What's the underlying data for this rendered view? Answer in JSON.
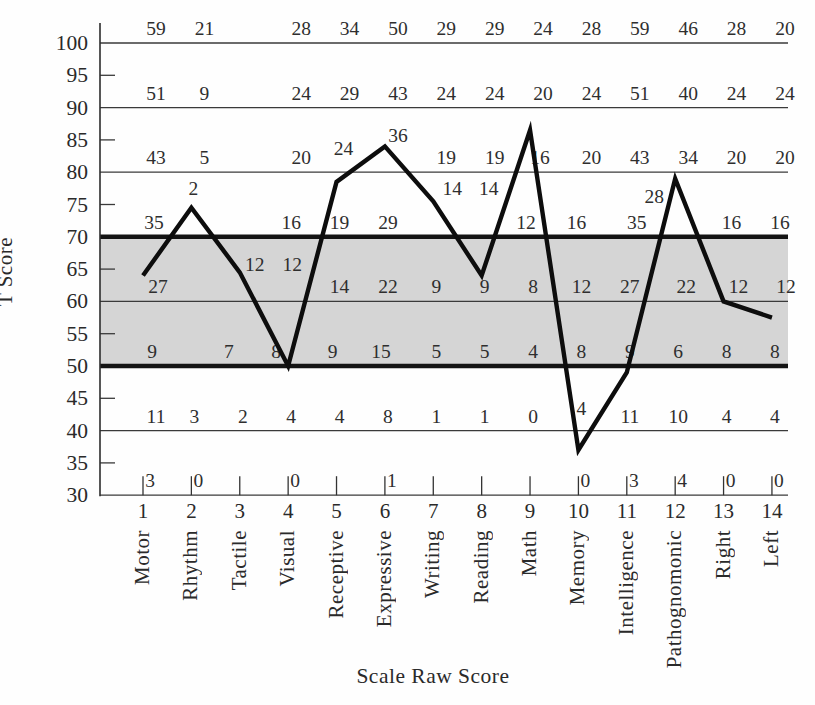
{
  "chart_data": {
    "type": "line",
    "title": "",
    "xlabel": "Scale Raw Score",
    "ylabel": "T Score",
    "ylim": [
      30,
      100
    ],
    "grid": "horizontal-only",
    "legend": "none",
    "y_tick_labels": [
      "100",
      "95",
      "90",
      "85",
      "80",
      "75",
      "70",
      "65",
      "60",
      "55",
      "50",
      "45",
      "40",
      "35",
      "30"
    ],
    "thin_gridlines_t": [
      100,
      90,
      80,
      60,
      40,
      30
    ],
    "thick_gridlines_t": [
      70,
      50
    ],
    "minor_tick_t": [
      95,
      85,
      75,
      65,
      55,
      45,
      35
    ],
    "normal_band": {
      "t_low": 50,
      "t_high": 70,
      "fill": "#d5d5d5"
    },
    "line_color": "#0d0d0d",
    "categories": [
      {
        "num": "1",
        "name": "Motor"
      },
      {
        "num": "2",
        "name": "Rhythm"
      },
      {
        "num": "3",
        "name": "Tactile"
      },
      {
        "num": "4",
        "name": "Visual"
      },
      {
        "num": "5",
        "name": "Receptive"
      },
      {
        "num": "6",
        "name": "Expressive"
      },
      {
        "num": "7",
        "name": "Writing"
      },
      {
        "num": "8",
        "name": "Reading"
      },
      {
        "num": "9",
        "name": "Math"
      },
      {
        "num": "10",
        "name": "Memory"
      },
      {
        "num": "11",
        "name": "Intelligence"
      },
      {
        "num": "12",
        "name": "Pathognomonic"
      },
      {
        "num": "13",
        "name": "Right"
      },
      {
        "num": "14",
        "name": "Left"
      }
    ],
    "series": [
      {
        "name": "T-score profile",
        "values_t": [
          64,
          74.5,
          64.5,
          50,
          78.5,
          84,
          75.5,
          64,
          86.5,
          37,
          49,
          79,
          60,
          57.5
        ]
      }
    ],
    "raw_score_rows": [
      {
        "t": 100,
        "rdx": 13,
        "labels": [
          {
            "col": 1,
            "v": "59"
          },
          {
            "col": 2,
            "v": "21"
          },
          {
            "col": 4,
            "v": "28"
          },
          {
            "col": 5,
            "v": "34"
          },
          {
            "col": 6,
            "v": "50"
          },
          {
            "col": 7,
            "v": "29"
          },
          {
            "col": 8,
            "v": "29"
          },
          {
            "col": 9,
            "v": "24"
          },
          {
            "col": 10,
            "v": "28"
          },
          {
            "col": 11,
            "v": "59"
          },
          {
            "col": 12,
            "v": "46"
          },
          {
            "col": 13,
            "v": "28"
          },
          {
            "col": 14,
            "v": "20"
          }
        ]
      },
      {
        "t": 90,
        "rdx": 13,
        "labels": [
          {
            "col": 1,
            "v": "51"
          },
          {
            "col": 2,
            "v": "9"
          },
          {
            "col": 4,
            "v": "24"
          },
          {
            "col": 5,
            "v": "29"
          },
          {
            "col": 6,
            "v": "43"
          },
          {
            "col": 7,
            "v": "24"
          },
          {
            "col": 8,
            "v": "24"
          },
          {
            "col": 9,
            "v": "20"
          },
          {
            "col": 10,
            "v": "24"
          },
          {
            "col": 11,
            "v": "51"
          },
          {
            "col": 12,
            "v": "40"
          },
          {
            "col": 13,
            "v": "24"
          },
          {
            "col": 14,
            "v": "24"
          }
        ]
      },
      {
        "t": 80,
        "rdx": 13,
        "labels": [
          {
            "col": 1,
            "v": "43"
          },
          {
            "col": 2,
            "v": "5"
          },
          {
            "col": 4,
            "v": "20"
          },
          {
            "col": 5,
            "v": "24",
            "t": 81.4,
            "dx": -6
          },
          {
            "col": 6,
            "v": "36",
            "t": 83.5
          },
          {
            "col": 7,
            "v": "19"
          },
          {
            "col": 8,
            "v": "19"
          },
          {
            "col": 9,
            "v": "16",
            "dx": -3
          },
          {
            "col": 10,
            "v": "20"
          },
          {
            "col": 11,
            "v": "43"
          },
          {
            "col": 12,
            "v": "34"
          },
          {
            "col": 13,
            "v": "20"
          },
          {
            "col": 14,
            "v": "20"
          }
        ]
      },
      {
        "t": 70,
        "rdx": 3,
        "labels": [
          {
            "col": 1,
            "v": "35",
            "dx": 8
          },
          {
            "col": 2,
            "v": "2",
            "t": 75.3,
            "dx": -1
          },
          {
            "col": 4,
            "v": "16"
          },
          {
            "col": 5,
            "v": "19"
          },
          {
            "col": 6,
            "v": "29"
          },
          {
            "col": 7,
            "v": "14",
            "t": 75.3,
            "dx": 16
          },
          {
            "col": 8,
            "v": "14",
            "t": 75.3,
            "dx": 4
          },
          {
            "col": 9,
            "v": "12",
            "dx": -7
          },
          {
            "col": 10,
            "v": "16",
            "dx": -5
          },
          {
            "col": 11,
            "v": "35",
            "dx": 7
          },
          {
            "col": 12,
            "v": "28",
            "t": 74,
            "dx": -24
          },
          {
            "col": 13,
            "v": "16",
            "dx": 5
          },
          {
            "col": 14,
            "v": "16",
            "dx": 5
          }
        ]
      },
      {
        "t": 60,
        "rdx": 3,
        "labels": [
          {
            "col": 1,
            "v": "27",
            "dx": 12
          },
          {
            "col": 3,
            "v": "12",
            "t": 63.4,
            "dx": 12
          },
          {
            "col": 4,
            "v": "12",
            "t": 63.4,
            "dx": 1
          },
          {
            "col": 5,
            "v": "14"
          },
          {
            "col": 6,
            "v": "22"
          },
          {
            "col": 7,
            "v": "9"
          },
          {
            "col": 8,
            "v": "9"
          },
          {
            "col": 9,
            "v": "8"
          },
          {
            "col": 10,
            "v": "12"
          },
          {
            "col": 11,
            "v": "27"
          },
          {
            "col": 12,
            "v": "22",
            "dx": 8
          },
          {
            "col": 13,
            "v": "12",
            "dx": 12
          },
          {
            "col": 14,
            "v": "12",
            "dx": 11
          }
        ]
      },
      {
        "t": 50,
        "rdx": 3,
        "labels": [
          {
            "col": 1,
            "v": "9",
            "dx": 6
          },
          {
            "col": 3,
            "v": "7",
            "dx": -14
          },
          {
            "col": 4,
            "v": "8",
            "dx": -15
          },
          {
            "col": 5,
            "v": "9",
            "dx": -7
          },
          {
            "col": 6,
            "v": "15",
            "dx": -7
          },
          {
            "col": 7,
            "v": "5"
          },
          {
            "col": 8,
            "v": "5"
          },
          {
            "col": 9,
            "v": "4"
          },
          {
            "col": 10,
            "v": "8"
          },
          {
            "col": 11,
            "v": "9"
          },
          {
            "col": 12,
            "v": "6"
          },
          {
            "col": 13,
            "v": "8"
          },
          {
            "col": 14,
            "v": "8"
          }
        ]
      },
      {
        "t": 40,
        "rdx": 3,
        "labels": [
          {
            "col": 1,
            "v": "11",
            "dx": 10
          },
          {
            "col": 2,
            "v": "3"
          },
          {
            "col": 3,
            "v": "2"
          },
          {
            "col": 4,
            "v": "4"
          },
          {
            "col": 5,
            "v": "4"
          },
          {
            "col": 6,
            "v": "8"
          },
          {
            "col": 7,
            "v": "1"
          },
          {
            "col": 8,
            "v": "1"
          },
          {
            "col": 9,
            "v": "0"
          },
          {
            "col": 10,
            "v": "4",
            "t": 41.1
          },
          {
            "col": 11,
            "v": "11"
          },
          {
            "col": 12,
            "v": "10"
          },
          {
            "col": 13,
            "v": "4"
          },
          {
            "col": 14,
            "v": "4"
          }
        ]
      },
      {
        "t": 30,
        "rdx": 7,
        "labels": [
          {
            "col": 1,
            "v": "3"
          },
          {
            "col": 2,
            "v": "0"
          },
          {
            "col": 4,
            "v": "0"
          },
          {
            "col": 6,
            "v": "1"
          },
          {
            "col": 10,
            "v": "0"
          },
          {
            "col": 11,
            "v": "3"
          },
          {
            "col": 12,
            "v": "4"
          },
          {
            "col": 13,
            "v": "0"
          },
          {
            "col": 14,
            "v": "0"
          }
        ]
      }
    ],
    "bottom_tick_cols": [
      1,
      2,
      3,
      4,
      5,
      6,
      7,
      8,
      9,
      10,
      11,
      12,
      13,
      14
    ]
  }
}
